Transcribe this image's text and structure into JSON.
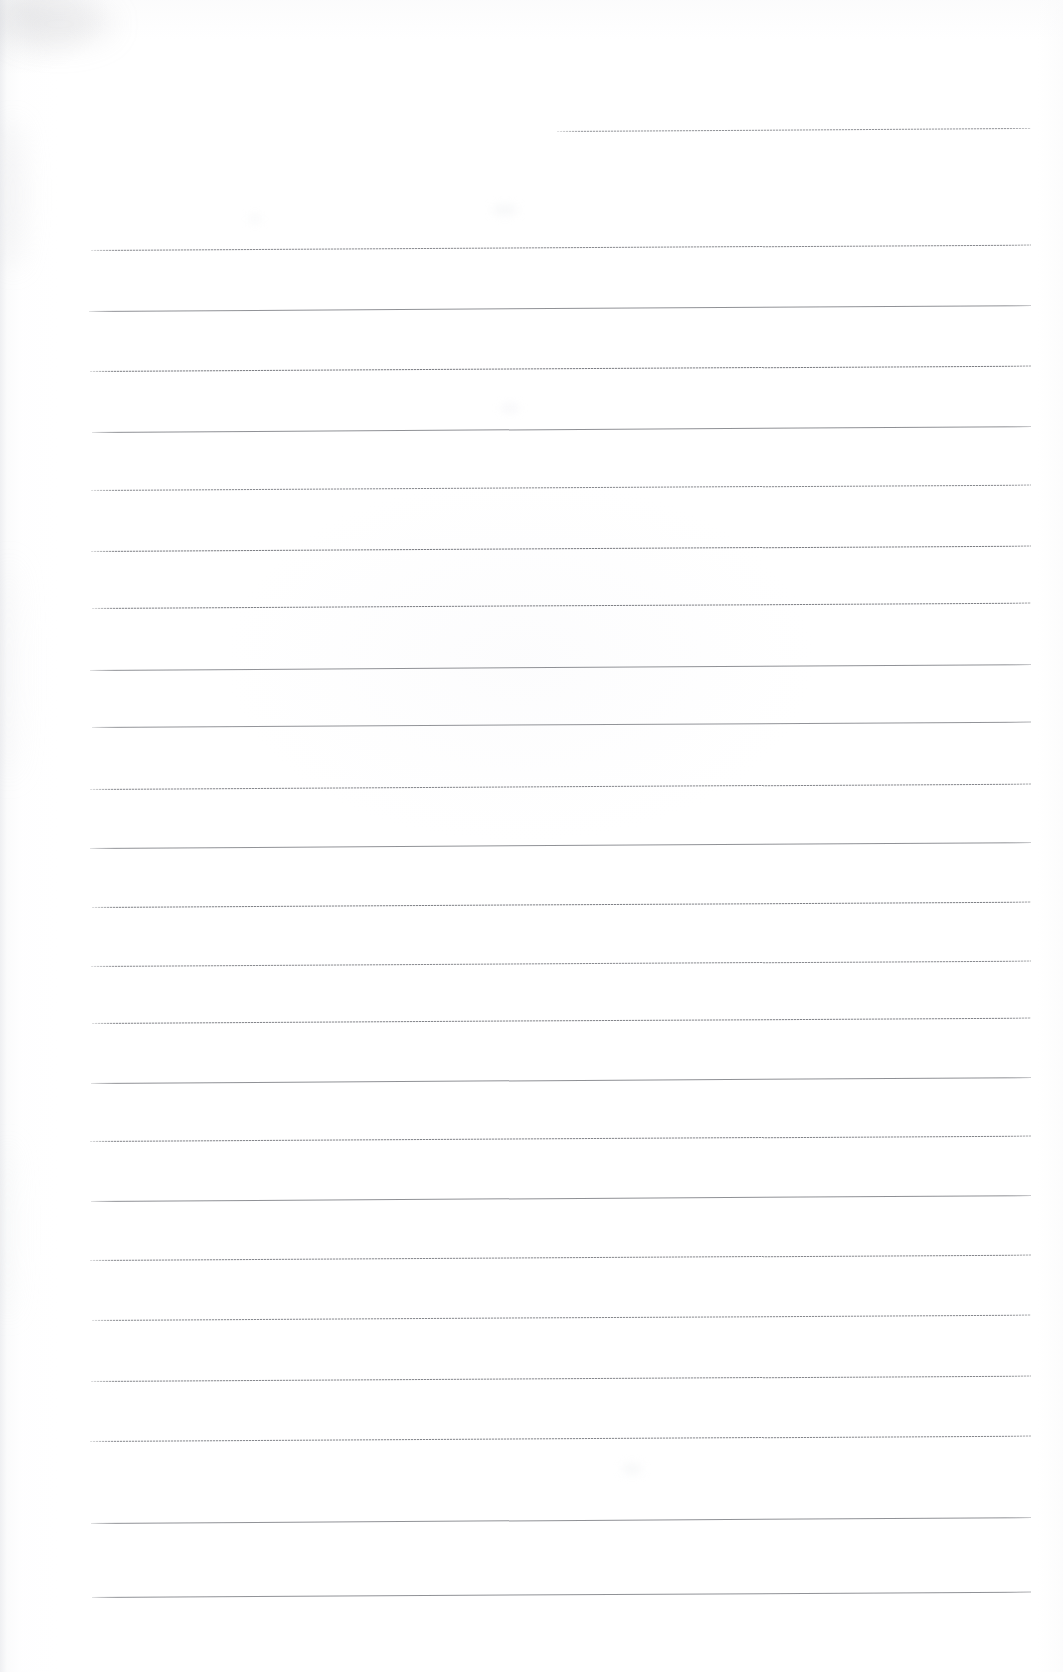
{
  "document": {
    "kind": "scanned-lined-paper",
    "title": "Blank ruled writing paper (scan)",
    "page_width": 1063,
    "page_height": 1672,
    "background_color": "#ffffff",
    "rule_color": "#55575d",
    "rule_color_light": "#b0b2b8",
    "text_content": "",
    "is_blank": true
  },
  "geometry": {
    "rule_left_x": 91,
    "rule_right_x": 1031,
    "rule_thickness": 1,
    "rule_spacing": 62,
    "skew_degrees": -0.33,
    "first_full_rule_y": 247,
    "last_full_rule_y": 1597,
    "full_rule_count": 22
  },
  "rules": [
    {
      "id": "rule-partial-top",
      "x": 557,
      "y": 131,
      "width": 474,
      "texture": "tex-b",
      "skew": -0.36,
      "opacity": 0.78
    },
    {
      "id": "rule-01",
      "x": 91,
      "y": 250,
      "width": 940,
      "texture": "tex-a",
      "skew": -0.33,
      "opacity": 0.72
    },
    {
      "id": "rule-02",
      "x": 89,
      "y": 311,
      "width": 942,
      "texture": "tex-c",
      "skew": -0.36,
      "opacity": 0.95
    },
    {
      "id": "rule-03",
      "x": 90,
      "y": 371,
      "width": 941,
      "texture": "tex-a",
      "skew": -0.33,
      "opacity": 0.8
    },
    {
      "id": "rule-04",
      "x": 92,
      "y": 432,
      "width": 939,
      "texture": "tex-c",
      "skew": -0.36,
      "opacity": 0.96
    },
    {
      "id": "rule-05",
      "x": 91,
      "y": 490,
      "width": 940,
      "texture": "tex-b",
      "skew": -0.33,
      "opacity": 0.85
    },
    {
      "id": "rule-06",
      "x": 91,
      "y": 551,
      "width": 940,
      "texture": "tex-a",
      "skew": -0.33,
      "opacity": 0.8
    },
    {
      "id": "rule-07",
      "x": 92,
      "y": 608,
      "width": 939,
      "texture": "tex-a",
      "skew": -0.33,
      "opacity": 0.78
    },
    {
      "id": "rule-08",
      "x": 90,
      "y": 670,
      "width": 941,
      "texture": "tex-c",
      "skew": -0.36,
      "opacity": 0.95
    },
    {
      "id": "rule-09",
      "x": 92,
      "y": 727,
      "width": 939,
      "texture": "tex-c",
      "skew": -0.33,
      "opacity": 0.93
    },
    {
      "id": "rule-10",
      "x": 90,
      "y": 789,
      "width": 941,
      "texture": "tex-a",
      "skew": -0.33,
      "opacity": 0.74
    },
    {
      "id": "rule-11",
      "x": 90,
      "y": 848,
      "width": 941,
      "texture": "tex-c",
      "skew": -0.36,
      "opacity": 0.95
    },
    {
      "id": "rule-12",
      "x": 92,
      "y": 907,
      "width": 939,
      "texture": "tex-a",
      "skew": -0.33,
      "opacity": 0.78
    },
    {
      "id": "rule-13",
      "x": 91,
      "y": 966,
      "width": 940,
      "texture": "tex-a",
      "skew": -0.33,
      "opacity": 0.72
    },
    {
      "id": "rule-14",
      "x": 92,
      "y": 1023,
      "width": 939,
      "texture": "tex-a",
      "skew": -0.33,
      "opacity": 0.76
    },
    {
      "id": "rule-15",
      "x": 91,
      "y": 1083,
      "width": 940,
      "texture": "tex-c",
      "skew": -0.36,
      "opacity": 0.96
    },
    {
      "id": "rule-16",
      "x": 90,
      "y": 1141,
      "width": 941,
      "texture": "tex-a",
      "skew": -0.33,
      "opacity": 0.76
    },
    {
      "id": "rule-17",
      "x": 91,
      "y": 1201,
      "width": 940,
      "texture": "tex-c",
      "skew": -0.36,
      "opacity": 0.96
    },
    {
      "id": "rule-18",
      "x": 90,
      "y": 1260,
      "width": 941,
      "texture": "tex-a",
      "skew": -0.33,
      "opacity": 0.74
    },
    {
      "id": "rule-19",
      "x": 92,
      "y": 1320,
      "width": 939,
      "texture": "tex-b",
      "skew": -0.33,
      "opacity": 0.86
    },
    {
      "id": "rule-20",
      "x": 91,
      "y": 1381,
      "width": 940,
      "texture": "tex-a",
      "skew": -0.33,
      "opacity": 0.74
    },
    {
      "id": "rule-21",
      "x": 90,
      "y": 1441,
      "width": 941,
      "texture": "tex-b",
      "skew": -0.33,
      "opacity": 0.88
    },
    {
      "id": "rule-22",
      "x": 91,
      "y": 1523,
      "width": 940,
      "texture": "tex-c",
      "skew": -0.36,
      "opacity": 0.95
    },
    {
      "id": "rule-23",
      "x": 92,
      "y": 1597,
      "width": 939,
      "texture": "tex-c",
      "skew": -0.33,
      "opacity": 0.95
    }
  ],
  "blotches": [
    {
      "id": "blotch-corner",
      "x": 4,
      "y": 2,
      "w": 110,
      "h": 44,
      "color": "rgba(172,174,180,0.16)",
      "blur": 14
    },
    {
      "id": "blotch-left-upper",
      "x": 0,
      "y": 120,
      "w": 26,
      "h": 150,
      "color": "rgba(214,216,220,0.22)",
      "blur": 12
    },
    {
      "id": "blotch-mid-a",
      "x": 492,
      "y": 205,
      "w": 26,
      "h": 10,
      "color": "rgba(226,228,232,0.30)",
      "blur": 5
    },
    {
      "id": "blotch-mid-b",
      "x": 248,
      "y": 215,
      "w": 14,
      "h": 8,
      "color": "rgba(230,232,236,0.28)",
      "blur": 4
    },
    {
      "id": "blotch-mid-c",
      "x": 500,
      "y": 404,
      "w": 20,
      "h": 8,
      "color": "rgba(228,230,234,0.30)",
      "blur": 4
    },
    {
      "id": "blotch-left-mid",
      "x": 0,
      "y": 560,
      "w": 18,
      "h": 220,
      "color": "rgba(222,224,228,0.18)",
      "blur": 14
    },
    {
      "id": "blotch-lower",
      "x": 622,
      "y": 1464,
      "w": 20,
      "h": 10,
      "color": "rgba(226,228,232,0.30)",
      "blur": 5
    },
    {
      "id": "blotch-bottom-left",
      "x": 0,
      "y": 1140,
      "w": 16,
      "h": 180,
      "color": "rgba(226,228,232,0.16)",
      "blur": 12
    }
  ]
}
